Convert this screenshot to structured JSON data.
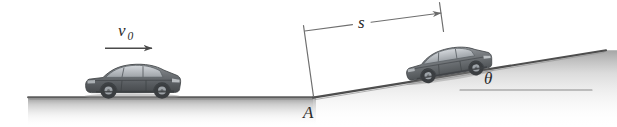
{
  "figure": {
    "width": 617,
    "height": 127,
    "background_color": "#ffffff"
  },
  "labels": {
    "initial_velocity": "v",
    "initial_velocity_subscript": "0",
    "distance": "s",
    "point": "A",
    "angle": "θ"
  },
  "elements": {
    "ground_label": "level ground",
    "incline_label": "inclined ramp",
    "car_left_label": "car on level ground",
    "car_right_label": "car on incline",
    "velocity_arrow_label": "velocity arrow",
    "dimension_line_label": "distance dimension line",
    "angle_reference_label": "horizontal reference line"
  },
  "colors": {
    "ink": "#2b2b2b",
    "line": "#4a4a4a",
    "ground_dark": "#6e6e6e",
    "ground_light": "#f2f2f2",
    "incline_dark": "#5a5a5a",
    "incline_light": "#ededed",
    "car_body_dark": "#4f5256",
    "car_body_mid": "#6a6e72",
    "car_body_light": "#8d9195",
    "car_glass": "#b9bec3",
    "car_tire": "#3a3d40",
    "car_rim": "#9aa0a5",
    "background": "#ffffff"
  },
  "geometry": {
    "ground_y": 97,
    "ground_x_start": 28,
    "point_a_x": 313,
    "incline_end_x": 605,
    "incline_end_y": 50,
    "incline_angle_degrees": 8.5
  }
}
